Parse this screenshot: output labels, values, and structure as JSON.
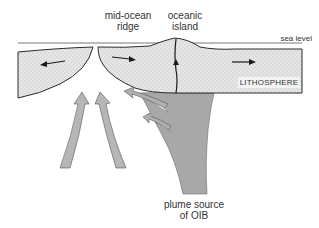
{
  "diagram": {
    "type": "geological cross-section",
    "labels": {
      "ridge": [
        "mid-ocean",
        "ridge"
      ],
      "island": [
        "oceanic",
        "island"
      ],
      "sea_level": "sea level",
      "lithosphere": "LITHOSPHERE",
      "plume": [
        "plume source",
        "of OIB"
      ]
    },
    "colors": {
      "lithosphere_fill": "#e4e4e4",
      "lithosphere_stipple": "#9a9a9a",
      "plume_fill": "#a8a8a8",
      "outline": "#2a2a2a",
      "upwelling_arrow_fill": "#b5b5b5"
    },
    "arrows": {
      "plate_motion": [
        "left (left plate)",
        "right (right plate, near ridge)",
        "right (right plate, far side)"
      ],
      "upwelling_under_ridge": 2,
      "plume_branch_arrows": 2,
      "island_conduit_arrow": "up"
    }
  }
}
